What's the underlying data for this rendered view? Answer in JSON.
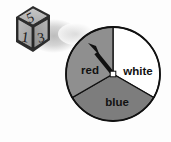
{
  "figure": {
    "background_color": "#fdfdfd"
  },
  "die": {
    "name": "six-sided-die",
    "top_face_value": "5",
    "left_face_value": "1",
    "right_face_value": "3",
    "body_color": "#2b2b2b",
    "face_color": "#b4b4b4",
    "shadow_color": "#cfcfcf",
    "center": {
      "x": 33,
      "y": 32
    },
    "size": 27
  },
  "spinner": {
    "name": "three-sector-spinner",
    "center": {
      "x": 113,
      "y": 74
    },
    "radius": 47,
    "outline_color": "#111111",
    "pivot_color": "#ffffff",
    "arrow_color": "#111111",
    "arrow_points_to": "red",
    "arrow_angle_degrees": 315,
    "sectors": [
      {
        "label": "red",
        "fill": "#8f8f8f",
        "start_angle_degrees": 240,
        "end_angle_degrees": 360,
        "share": "1/3",
        "label_x": 90,
        "label_y": 70
      },
      {
        "label": "white",
        "fill": "#ffffff",
        "start_angle_degrees": 0,
        "end_angle_degrees": 120,
        "share": "1/3",
        "label_x": 137,
        "label_y": 71
      },
      {
        "label": "blue",
        "fill": "#7d7d7d",
        "start_angle_degrees": 120,
        "end_angle_degrees": 240,
        "share": "1/3",
        "label_x": 117,
        "label_y": 102
      }
    ]
  }
}
